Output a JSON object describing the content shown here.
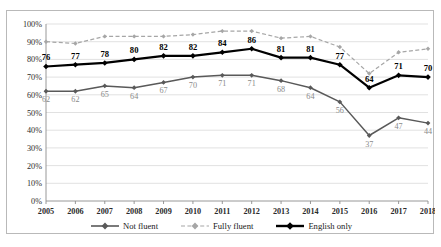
{
  "chart_data": {
    "type": "line",
    "title": "",
    "xlabel": "",
    "ylabel": "",
    "categories": [
      "2005",
      "2006",
      "2007",
      "2008",
      "2009",
      "2010",
      "2011",
      "2012",
      "2013",
      "2014",
      "2015",
      "2016",
      "2017",
      "2018"
    ],
    "ylim": [
      0,
      100
    ],
    "ytick_labels": [
      "0%",
      "10%",
      "20%",
      "30%",
      "40%",
      "50%",
      "60%",
      "70%",
      "80%",
      "90%",
      "100%"
    ],
    "ytick_values": [
      0,
      10,
      20,
      30,
      40,
      50,
      60,
      70,
      80,
      90,
      100
    ],
    "grid": true,
    "legend_position": "bottom",
    "series": [
      {
        "name": "Not fluent",
        "style": "solid",
        "color": "#595959",
        "marker": "diamond",
        "show_labels": true,
        "values": [
          62,
          62,
          65,
          64,
          67,
          70,
          71,
          71,
          68,
          64,
          56,
          37,
          47,
          44
        ]
      },
      {
        "name": "Fully fluent",
        "style": "dashed",
        "color": "#a6a6a6",
        "marker": "diamond",
        "show_labels": false,
        "values": [
          90,
          89,
          93,
          93,
          93,
          94,
          96,
          96,
          92,
          93,
          87,
          72,
          84,
          86
        ]
      },
      {
        "name": "English only",
        "style": "solid-bold",
        "color": "#000000",
        "marker": "diamond",
        "show_labels": true,
        "values": [
          76,
          77,
          78,
          80,
          82,
          82,
          84,
          86,
          81,
          81,
          77,
          64,
          71,
          70
        ]
      }
    ]
  },
  "legend": {
    "items": [
      {
        "label": "Not fluent"
      },
      {
        "label": "Fully fluent"
      },
      {
        "label": "English only"
      }
    ]
  },
  "title_remnant": ""
}
